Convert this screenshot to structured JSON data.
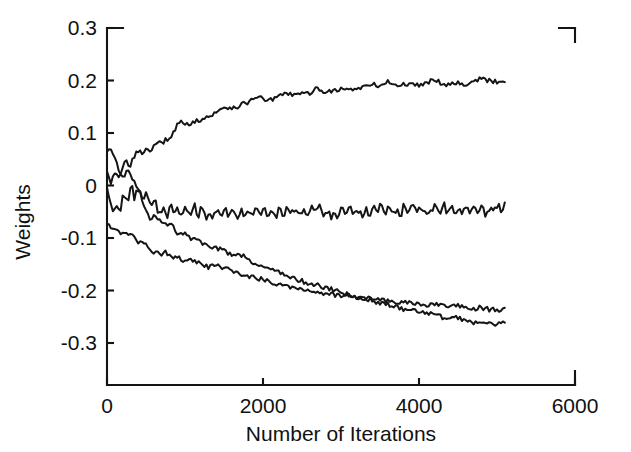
{
  "figure": {
    "background_color": "#ffffff",
    "line_color": "#151515",
    "axis_color": "#141414"
  },
  "chart_data": {
    "type": "line",
    "title": "",
    "subtitle": "",
    "xlabel": "Number of Iterations",
    "ylabel": "Weights",
    "xlim": [
      0,
      6000
    ],
    "ylim": [
      -0.38,
      0.3
    ],
    "xticks": [
      0,
      2000,
      4000,
      6000
    ],
    "xtick_labels": [
      "0",
      "2000",
      "4000",
      "6000"
    ],
    "yticks": [
      0.3,
      0.2,
      0.1,
      0,
      -0.1,
      -0.2,
      -0.3
    ],
    "ytick_labels": [
      "0.3",
      "0.2",
      "0.1",
      "0",
      "-0.1",
      "-0.2",
      "-0.3"
    ],
    "grid": false,
    "legend": null,
    "annotations": [],
    "data_x_end": 5100,
    "series": [
      {
        "name": "weight-1-rising",
        "color": "#151515",
        "x": [
          0,
          50,
          100,
          150,
          200,
          250,
          300,
          350,
          400,
          450,
          500,
          550,
          600,
          650,
          700,
          750,
          800,
          850,
          900,
          950,
          1000,
          1100,
          1200,
          1300,
          1400,
          1500,
          1600,
          1700,
          1800,
          1900,
          2000,
          2100,
          2200,
          2300,
          2400,
          2500,
          2600,
          2700,
          2800,
          2900,
          3000,
          3100,
          3200,
          3300,
          3400,
          3500,
          3600,
          3700,
          3800,
          3900,
          4000,
          4100,
          4200,
          4300,
          4400,
          4500,
          4600,
          4700,
          4800,
          4900,
          5000,
          5100
        ],
        "y": [
          0.03,
          0.008,
          0.02,
          0.012,
          0.034,
          0.045,
          0.042,
          0.058,
          0.063,
          0.062,
          0.07,
          0.068,
          0.073,
          0.078,
          0.082,
          0.086,
          0.091,
          0.101,
          0.115,
          0.121,
          0.113,
          0.122,
          0.126,
          0.131,
          0.138,
          0.15,
          0.148,
          0.152,
          0.158,
          0.17,
          0.164,
          0.163,
          0.168,
          0.177,
          0.172,
          0.174,
          0.176,
          0.186,
          0.178,
          0.181,
          0.184,
          0.182,
          0.185,
          0.188,
          0.192,
          0.19,
          0.198,
          0.19,
          0.193,
          0.192,
          0.192,
          0.197,
          0.202,
          0.194,
          0.193,
          0.196,
          0.193,
          0.198,
          0.204,
          0.199,
          0.198,
          0.198
        ]
      },
      {
        "name": "weight-2-flat",
        "color": "#151515",
        "x": [
          0,
          50,
          100,
          150,
          200,
          250,
          300,
          350,
          400,
          450,
          500,
          550,
          600,
          650,
          700,
          750,
          800,
          850,
          900,
          950,
          1000,
          1100,
          1200,
          1300,
          1400,
          1500,
          1600,
          1700,
          1800,
          1900,
          2000,
          2100,
          2200,
          2300,
          2400,
          2500,
          2600,
          2700,
          2800,
          2900,
          3000,
          3100,
          3200,
          3300,
          3400,
          3500,
          3600,
          3700,
          3800,
          3900,
          4000,
          4100,
          4200,
          4300,
          4400,
          4500,
          4600,
          4700,
          4800,
          4900,
          5000,
          5100
        ],
        "y": [
          -0.006,
          -0.03,
          -0.047,
          -0.04,
          -0.033,
          -0.024,
          -0.019,
          -0.016,
          -0.014,
          -0.015,
          -0.018,
          -0.023,
          -0.031,
          -0.041,
          -0.049,
          -0.055,
          -0.05,
          -0.043,
          -0.052,
          -0.058,
          -0.05,
          -0.043,
          -0.052,
          -0.057,
          -0.05,
          -0.045,
          -0.053,
          -0.057,
          -0.05,
          -0.044,
          -0.051,
          -0.056,
          -0.05,
          -0.045,
          -0.052,
          -0.056,
          -0.049,
          -0.044,
          -0.05,
          -0.055,
          -0.048,
          -0.044,
          -0.049,
          -0.054,
          -0.047,
          -0.043,
          -0.049,
          -0.053,
          -0.046,
          -0.042,
          -0.048,
          -0.052,
          -0.045,
          -0.041,
          -0.047,
          -0.051,
          -0.044,
          -0.041,
          -0.046,
          -0.05,
          -0.043,
          -0.037
        ]
      },
      {
        "name": "weight-3-steep-decline",
        "color": "#151515",
        "x": [
          0,
          50,
          100,
          150,
          200,
          250,
          300,
          350,
          400,
          450,
          500,
          550,
          600,
          650,
          700,
          750,
          800,
          850,
          900,
          950,
          1000,
          1100,
          1200,
          1300,
          1400,
          1500,
          1600,
          1700,
          1800,
          1900,
          2000,
          2100,
          2200,
          2300,
          2400,
          2500,
          2600,
          2700,
          2800,
          2900,
          3000,
          3100,
          3200,
          3300,
          3400,
          3500,
          3600,
          3700,
          3800,
          3900,
          4000,
          4100,
          4200,
          4300,
          4400,
          4500,
          4600,
          4700,
          4800,
          4900,
          5000,
          5100
        ],
        "y": [
          0.066,
          0.062,
          0.046,
          0.03,
          0.022,
          0.025,
          0.02,
          0.01,
          -0.005,
          -0.026,
          -0.048,
          -0.062,
          -0.058,
          -0.062,
          -0.072,
          -0.076,
          -0.071,
          -0.079,
          -0.089,
          -0.087,
          -0.093,
          -0.102,
          -0.109,
          -0.113,
          -0.119,
          -0.124,
          -0.131,
          -0.13,
          -0.139,
          -0.148,
          -0.155,
          -0.16,
          -0.163,
          -0.172,
          -0.178,
          -0.182,
          -0.186,
          -0.19,
          -0.195,
          -0.199,
          -0.204,
          -0.208,
          -0.213,
          -0.215,
          -0.219,
          -0.223,
          -0.226,
          -0.231,
          -0.236,
          -0.234,
          -0.24,
          -0.243,
          -0.246,
          -0.251,
          -0.254,
          -0.252,
          -0.257,
          -0.26,
          -0.258,
          -0.262,
          -0.264,
          -0.263
        ]
      },
      {
        "name": "weight-4-gradual-decline",
        "color": "#151515",
        "x": [
          0,
          50,
          100,
          150,
          200,
          250,
          300,
          350,
          400,
          450,
          500,
          550,
          600,
          650,
          700,
          750,
          800,
          850,
          900,
          950,
          1000,
          1100,
          1200,
          1300,
          1400,
          1500,
          1600,
          1700,
          1800,
          1900,
          2000,
          2100,
          2200,
          2300,
          2400,
          2500,
          2600,
          2700,
          2800,
          2900,
          3000,
          3100,
          3200,
          3300,
          3400,
          3500,
          3600,
          3700,
          3800,
          3900,
          4000,
          4100,
          4200,
          4300,
          4400,
          4500,
          4600,
          4700,
          4800,
          4900,
          5000,
          5100
        ],
        "y": [
          -0.072,
          -0.08,
          -0.085,
          -0.082,
          -0.09,
          -0.094,
          -0.09,
          -0.098,
          -0.107,
          -0.104,
          -0.112,
          -0.119,
          -0.126,
          -0.124,
          -0.131,
          -0.128,
          -0.133,
          -0.138,
          -0.134,
          -0.141,
          -0.147,
          -0.143,
          -0.15,
          -0.156,
          -0.152,
          -0.158,
          -0.163,
          -0.168,
          -0.172,
          -0.176,
          -0.179,
          -0.184,
          -0.187,
          -0.191,
          -0.194,
          -0.197,
          -0.2,
          -0.203,
          -0.206,
          -0.208,
          -0.211,
          -0.209,
          -0.213,
          -0.216,
          -0.214,
          -0.218,
          -0.22,
          -0.223,
          -0.221,
          -0.225,
          -0.227,
          -0.229,
          -0.226,
          -0.23,
          -0.232,
          -0.229,
          -0.233,
          -0.235,
          -0.232,
          -0.236,
          -0.237,
          -0.236
        ]
      }
    ]
  }
}
